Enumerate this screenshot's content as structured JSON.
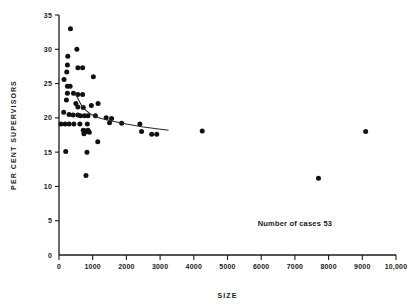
{
  "chart_data": {
    "type": "scatter",
    "title": "",
    "xlabel": "SIZE",
    "ylabel": "PER CENT SUPERVISORS",
    "xlim": [
      0,
      10000
    ],
    "ylim": [
      0,
      35
    ],
    "grid": false,
    "legend_position": "none",
    "x_ticks": [
      0,
      1000,
      2000,
      3000,
      4000,
      5000,
      6000,
      7000,
      8000,
      9000,
      10000
    ],
    "x_tick_labels": [
      "0",
      "1000",
      "2000",
      "3000",
      "4000",
      "5000",
      "6000",
      "7000",
      "8000",
      "9000",
      "10,000"
    ],
    "y_ticks": [
      0,
      5,
      10,
      15,
      20,
      25,
      30,
      35
    ],
    "y_tick_labels": [
      "0",
      "5",
      "10",
      "15",
      "20",
      "25",
      "30",
      "35"
    ],
    "annotations": [
      {
        "text": "Number of cases 53",
        "x": 7000,
        "y": 4.2
      }
    ],
    "points": [
      [
        340,
        33.0
      ],
      [
        260,
        29.0
      ],
      [
        530,
        30.0
      ],
      [
        250,
        27.7
      ],
      [
        230,
        26.7
      ],
      [
        560,
        27.3
      ],
      [
        700,
        27.3
      ],
      [
        1020,
        26.0
      ],
      [
        150,
        25.6
      ],
      [
        250,
        24.6
      ],
      [
        330,
        24.6
      ],
      [
        250,
        23.6
      ],
      [
        430,
        23.6
      ],
      [
        560,
        23.4
      ],
      [
        700,
        23.4
      ],
      [
        220,
        22.6
      ],
      [
        500,
        22.1
      ],
      [
        560,
        21.6
      ],
      [
        720,
        21.5
      ],
      [
        960,
        21.8
      ],
      [
        1160,
        22.1
      ],
      [
        140,
        20.8
      ],
      [
        300,
        20.5
      ],
      [
        420,
        20.4
      ],
      [
        560,
        20.4
      ],
      [
        640,
        20.3
      ],
      [
        760,
        20.3
      ],
      [
        860,
        20.3
      ],
      [
        1080,
        20.3
      ],
      [
        1400,
        20.0
      ],
      [
        1560,
        19.9
      ],
      [
        60,
        19.1
      ],
      [
        180,
        19.1
      ],
      [
        300,
        19.1
      ],
      [
        440,
        19.1
      ],
      [
        620,
        19.1
      ],
      [
        840,
        19.1
      ],
      [
        1500,
        19.3
      ],
      [
        1860,
        19.2
      ],
      [
        2400,
        19.1
      ],
      [
        720,
        18.2
      ],
      [
        780,
        18.1
      ],
      [
        820,
        18.0
      ],
      [
        860,
        18.2
      ],
      [
        900,
        17.9
      ],
      [
        740,
        17.7
      ],
      [
        2450,
        18.0
      ],
      [
        2750,
        17.6
      ],
      [
        2900,
        17.6
      ],
      [
        4250,
        18.1
      ],
      [
        9100,
        18.0
      ],
      [
        1150,
        16.5
      ],
      [
        200,
        15.1
      ],
      [
        830,
        15.0
      ],
      [
        800,
        11.6
      ],
      [
        7700,
        11.2
      ]
    ],
    "fit_curve": {
      "label": "fitted trend",
      "x": [
        480,
        700,
        950,
        1250,
        1600,
        2000,
        2450,
        2900,
        3250
      ],
      "y": [
        23.6,
        21.5,
        20.5,
        19.9,
        19.5,
        19.1,
        18.7,
        18.4,
        18.2
      ]
    }
  },
  "geometry": {
    "plot_left": 59,
    "plot_right": 396,
    "plot_bottom": 255,
    "plot_top": 15,
    "point_radius": 2.5
  }
}
